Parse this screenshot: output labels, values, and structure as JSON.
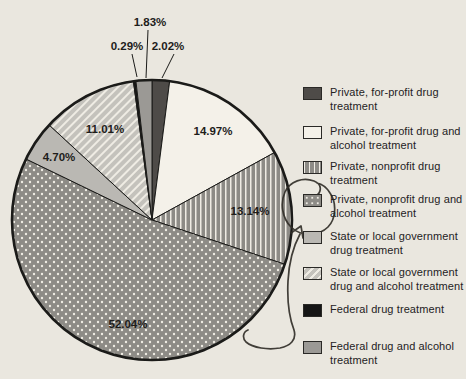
{
  "chart_data": {
    "type": "pie",
    "direction": "clockwise",
    "start_angle_deg": 0,
    "unit": "%",
    "slices": [
      {
        "label": "Private, for-profit drug treatment",
        "value": 2.02,
        "display": "2.02%",
        "pattern": "solid-dark",
        "label_placement": "outside"
      },
      {
        "label": "Private, for-profit drug and alcohol treatment",
        "value": 14.97,
        "display": "14.97%",
        "pattern": "solid-white",
        "label_placement": "inside"
      },
      {
        "label": "Private, nonprofit drug treatment",
        "value": 13.14,
        "display": "13.14%",
        "pattern": "vertical-lines",
        "label_placement": "inside"
      },
      {
        "label": "Private, nonprofit drug and alcohol treatment",
        "value": 52.04,
        "display": "52.04%",
        "pattern": "dots",
        "label_placement": "inside",
        "annotated": true
      },
      {
        "label": "State or local government drug treatment",
        "value": 4.7,
        "display": "4.70%",
        "pattern": "solid-light",
        "label_placement": "inside"
      },
      {
        "label": "State or local government drug and alcohol treatment",
        "value": 11.01,
        "display": "11.01%",
        "pattern": "diagonal-lines",
        "label_placement": "inside"
      },
      {
        "label": "Federal drug treatment",
        "value": 0.29,
        "display": "0.29%",
        "pattern": "solid-black",
        "label_placement": "outside"
      },
      {
        "label": "Federal drug and alcohol treatment",
        "value": 1.83,
        "display": "1.83%",
        "pattern": "solid-medium",
        "label_placement": "outside"
      }
    ],
    "legend": [
      {
        "pattern": "solid-dark",
        "lines": [
          "Private, for-profit drug",
          "treatment"
        ]
      },
      {
        "pattern": "solid-white",
        "lines": [
          "Private, for-profit drug and",
          "alcohol treatment"
        ]
      },
      {
        "pattern": "vertical-lines",
        "lines": [
          "Private, nonprofit drug",
          "treatment"
        ]
      },
      {
        "pattern": "dots",
        "lines": [
          "Private, nonprofit drug and",
          "alcohol treatment"
        ]
      },
      {
        "pattern": "solid-light",
        "lines": [
          "State or local government",
          "drug treatment"
        ]
      },
      {
        "pattern": "diagonal-lines",
        "lines": [
          "State or local government",
          "drug and alcohol treatment"
        ]
      },
      {
        "pattern": "solid-black",
        "lines": [
          "Federal drug treatment"
        ]
      },
      {
        "pattern": "solid-medium",
        "lines": [
          "Federal drug and alcohol",
          "treatment"
        ]
      }
    ],
    "legend_position": "right",
    "colors": {
      "background": "#eae7df",
      "solid-dark": "#4e4b48",
      "solid-white": "#f4f1e9",
      "solid-light": "#bab8b3",
      "solid-medium": "#9b9995",
      "solid-black": "#161616",
      "pattern-gray": "#8d8b86",
      "pattern-light": "#c4c2bc",
      "pattern-ink": "#efece4",
      "outline": "#1b1b19",
      "text": "#1e1d1b",
      "annotation-ink": "#33302a"
    },
    "annotation": {
      "style": "hand-drawn-pen",
      "target": "Private, nonprofit drug and alcohol treatment",
      "description": "Pen loop with curl circling the dotted legend swatch, an arrowhead pointing into the loop, and a long curved tail sweeping down the right side of the pie ending in a hook near the bottom of the 52.04% slice"
    }
  }
}
